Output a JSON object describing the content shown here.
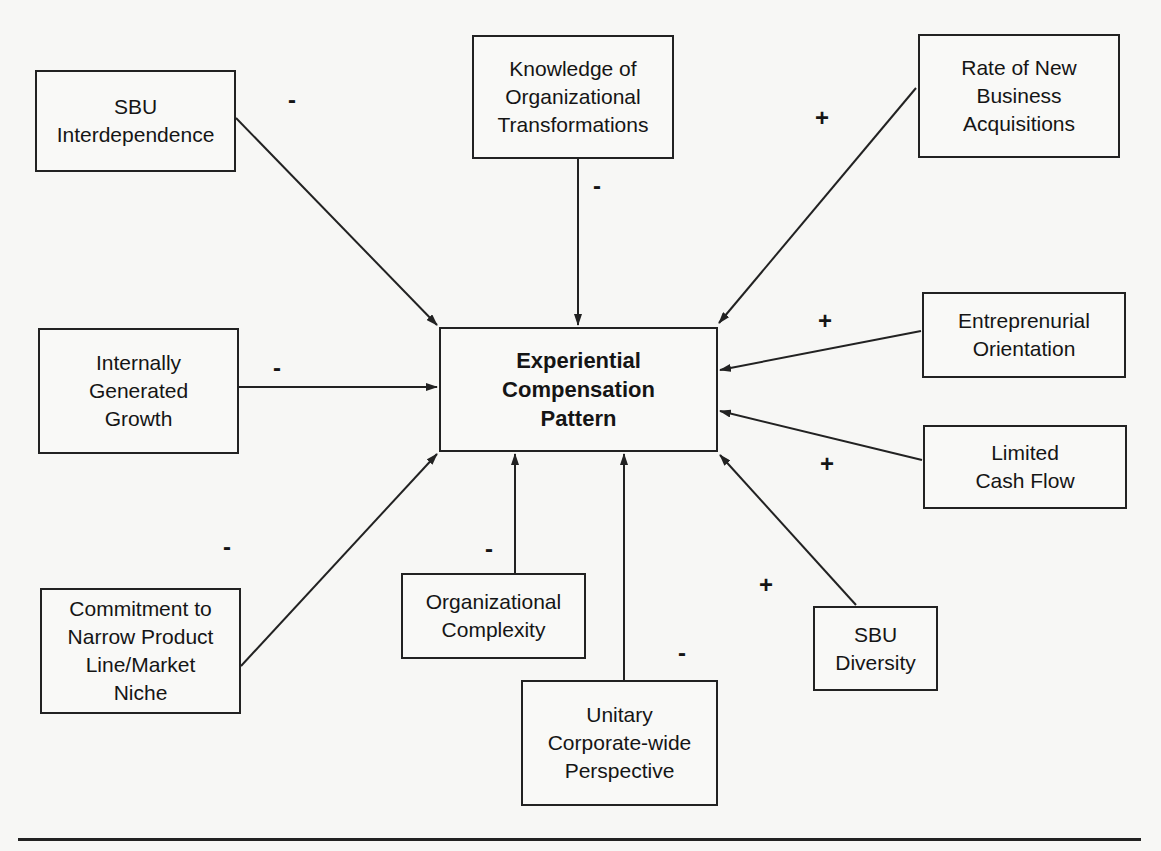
{
  "diagram": {
    "center": {
      "id": "center",
      "label": "Experiential\nCompensation\nPattern"
    },
    "factors": [
      {
        "id": "sbu-interdependence",
        "label": "SBU\nInterdependence",
        "sign": "-"
      },
      {
        "id": "knowledge-org-transformations",
        "label": "Knowledge of\nOrganizational\nTransformations",
        "sign": "-"
      },
      {
        "id": "rate-new-business-acquisitions",
        "label": "Rate of New\nBusiness\nAcquisitions",
        "sign": "+"
      },
      {
        "id": "internally-generated-growth",
        "label": "Internally\nGenerated\nGrowth",
        "sign": "-"
      },
      {
        "id": "entrepreneurial-orientation",
        "label": "Entreprenurial\nOrientation",
        "sign": "+"
      },
      {
        "id": "limited-cash-flow",
        "label": "Limited\nCash Flow",
        "sign": "+"
      },
      {
        "id": "commitment-narrow-product-line",
        "label": "Commitment to\nNarrow Product\nLine/Market\nNiche",
        "sign": "-"
      },
      {
        "id": "organizational-complexity",
        "label": "Organizational\nComplexity",
        "sign": "-"
      },
      {
        "id": "unitary-corporate-perspective",
        "label": "Unitary\nCorporate-wide\nPerspective",
        "sign": "-"
      },
      {
        "id": "sbu-diversity",
        "label": "SBU\nDiversity",
        "sign": "+"
      }
    ],
    "edges": [
      {
        "from": "sbu-interdependence",
        "to": "center",
        "sign": "-"
      },
      {
        "from": "knowledge-org-transformations",
        "to": "center",
        "sign": "-"
      },
      {
        "from": "rate-new-business-acquisitions",
        "to": "center",
        "sign": "+"
      },
      {
        "from": "internally-generated-growth",
        "to": "center",
        "sign": "-"
      },
      {
        "from": "entrepreneurial-orientation",
        "to": "center",
        "sign": "+"
      },
      {
        "from": "limited-cash-flow",
        "to": "center",
        "sign": "+"
      },
      {
        "from": "commitment-narrow-product-line",
        "to": "center",
        "sign": "-"
      },
      {
        "from": "organizational-complexity",
        "to": "center",
        "sign": "-"
      },
      {
        "from": "unitary-corporate-perspective",
        "to": "center",
        "sign": "-"
      },
      {
        "from": "sbu-diversity",
        "to": "center",
        "sign": "+"
      }
    ]
  }
}
